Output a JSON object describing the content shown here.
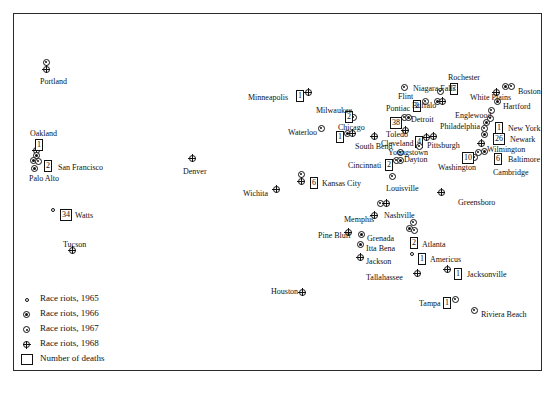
{
  "legend": {
    "items": [
      {
        "symbol": "open-circle-small",
        "label": "Race riots, 1965",
        "year": 1965
      },
      {
        "symbol": "filled-center-circle",
        "label": "Race riots, 1966",
        "year": 1966
      },
      {
        "symbol": "dot-circle",
        "label": "Race riots, 1967",
        "year": 1967
      },
      {
        "symbol": "crossed-circle",
        "label": "Race riots, 1968",
        "year": 1968
      }
    ],
    "deaths_label": "Number of deaths",
    "deaths_symbol": "square-box"
  },
  "map": {
    "background_color": "#d4d4d4",
    "border_color": "#2b2b2b",
    "water_color": "#ffffff",
    "cities": [
      {
        "name": "Portland",
        "label_x": 40,
        "label_y": 77,
        "markers": [
          {
            "x": 46,
            "y": 62,
            "year": 1967
          },
          {
            "x": 46,
            "y": 69,
            "year": 1968
          }
        ]
      },
      {
        "name": "Oakland",
        "label_x": 30,
        "label_y": 129,
        "deaths": "1",
        "deaths_x": 35,
        "deaths_y": 139,
        "markers": [
          {
            "x": 36,
            "y": 150,
            "year": 1968
          },
          {
            "x": 36,
            "y": 155,
            "year": 1966
          }
        ]
      },
      {
        "name": "San Francisco",
        "label_x": 58,
        "label_y": 163,
        "deaths": "2",
        "deaths_x": 44,
        "deaths_y": 160,
        "markers": [
          {
            "x": 33,
            "y": 160,
            "year": 1966
          },
          {
            "x": 38,
            "y": 161,
            "year": 1967
          }
        ]
      },
      {
        "name": "Palo Alto",
        "label_x": 29,
        "label_y": 174,
        "markers": [
          {
            "x": 34,
            "y": 168,
            "year": 1966
          }
        ]
      },
      {
        "name": "Watts",
        "label_x": 75,
        "label_y": 211,
        "deaths": "34",
        "deaths_x": 60,
        "deaths_y": 209,
        "markers": [
          {
            "x": 53,
            "y": 210,
            "year": 1965
          }
        ]
      },
      {
        "name": "Tucson",
        "label_x": 63,
        "label_y": 240,
        "markers": [
          {
            "x": 72,
            "y": 250,
            "year": 1968
          }
        ]
      },
      {
        "name": "Denver",
        "label_x": 183,
        "label_y": 167,
        "markers": [
          {
            "x": 192,
            "y": 158,
            "year": 1968
          }
        ]
      },
      {
        "name": "Wichita",
        "label_x": 243,
        "label_y": 189,
        "markers": [
          {
            "x": 276,
            "y": 189,
            "year": 1968
          }
        ]
      },
      {
        "name": "Kansas City",
        "label_x": 322,
        "label_y": 179,
        "deaths": "6",
        "deaths_x": 310,
        "deaths_y": 177,
        "markers": [
          {
            "x": 301,
            "y": 174,
            "year": 1967
          },
          {
            "x": 301,
            "y": 181,
            "year": 1968
          }
        ]
      },
      {
        "name": "Minneapolis",
        "label_x": 248,
        "label_y": 93,
        "deaths": "1",
        "deaths_x": 296,
        "deaths_y": 90,
        "markers": [
          {
            "x": 308,
            "y": 92,
            "year": 1968
          }
        ]
      },
      {
        "name": "Milwaukee",
        "label_x": 316,
        "label_y": 106,
        "deaths": "2",
        "deaths_x": 345,
        "deaths_y": 111,
        "markers": [
          {
            "x": 353,
            "y": 117,
            "year": 1967
          }
        ]
      },
      {
        "name": "Waterloo",
        "label_x": 288,
        "label_y": 128,
        "markers": [
          {
            "x": 321,
            "y": 128,
            "year": 1967
          }
        ]
      },
      {
        "name": "Chicago",
        "label_x": 338,
        "label_y": 123,
        "deaths": "1",
        "deaths_x": 336,
        "deaths_y": 131,
        "markers": [
          {
            "x": 347,
            "y": 133,
            "year": 1966
          },
          {
            "x": 352,
            "y": 133,
            "year": 1968
          }
        ]
      },
      {
        "name": "South Bend",
        "label_x": 355,
        "label_y": 142,
        "markers": [
          {
            "x": 374,
            "y": 136,
            "year": 1968
          }
        ]
      },
      {
        "name": "Pontiac",
        "label_x": 386,
        "label_y": 104,
        "deaths": "2",
        "deaths_x": 413,
        "deaths_y": 100,
        "markers": [
          {
            "x": 425,
            "y": 101,
            "year": 1967
          }
        ]
      },
      {
        "name": "Flint",
        "label_x": 398,
        "label_y": 92,
        "markers": [
          {
            "x": 404,
            "y": 87,
            "year": 1967
          }
        ]
      },
      {
        "name": "Detroit",
        "label_x": 411,
        "label_y": 115,
        "deaths": "38",
        "deaths_x": 390,
        "deaths_y": 117,
        "markers": [
          {
            "x": 404,
            "y": 117,
            "year": 1967
          },
          {
            "x": 408,
            "y": 117,
            "year": 1966
          }
        ]
      },
      {
        "name": "Toledo",
        "label_x": 386,
        "label_y": 130,
        "markers": [
          {
            "x": 405,
            "y": 130,
            "year": 1968
          }
        ]
      },
      {
        "name": "Cleveland",
        "label_x": 381,
        "label_y": 139,
        "deaths": "4",
        "deaths_x": 415,
        "deaths_y": 136,
        "markers": [
          {
            "x": 426,
            "y": 137,
            "year": 1968
          }
        ]
      },
      {
        "name": "Youngstown",
        "label_x": 388,
        "label_y": 148,
        "markers": [
          {
            "x": 419,
            "y": 146,
            "year": 1967
          }
        ]
      },
      {
        "name": "Dayton",
        "label_x": 404,
        "label_y": 155,
        "markers": [
          {
            "x": 400,
            "y": 152,
            "year": 1967
          }
        ]
      },
      {
        "name": "Cincinnati",
        "label_x": 348,
        "label_y": 161,
        "deaths": "2",
        "deaths_x": 385,
        "deaths_y": 159,
        "markers": [
          {
            "x": 396,
            "y": 160,
            "year": 1967
          },
          {
            "x": 400,
            "y": 160,
            "year": 1966
          }
        ]
      },
      {
        "name": "Louisville",
        "label_x": 386,
        "label_y": 184,
        "markers": [
          {
            "x": 392,
            "y": 176,
            "year": 1967
          }
        ]
      },
      {
        "name": "Niagara Falls",
        "label_x": 413,
        "label_y": 84,
        "markers": [
          {
            "x": 440,
            "y": 91,
            "year": 1967
          }
        ]
      },
      {
        "name": "Buffalo",
        "label_x": 412,
        "label_y": 101,
        "markers": [
          {
            "x": 437,
            "y": 101,
            "year": 1966
          },
          {
            "x": 442,
            "y": 101,
            "year": 1968
          }
        ]
      },
      {
        "name": "Rochester",
        "label_x": 448,
        "label_y": 73,
        "deaths": "7",
        "deaths_x": 450,
        "deaths_y": 83,
        "markers": []
      },
      {
        "name": "White Plains",
        "label_x": 470,
        "label_y": 93,
        "markers": [
          {
            "x": 496,
            "y": 92,
            "year": 1968
          }
        ]
      },
      {
        "name": "Hartford",
        "label_x": 503,
        "label_y": 102,
        "markers": [
          {
            "x": 497,
            "y": 101,
            "year": 1966
          }
        ]
      },
      {
        "name": "Boston",
        "label_x": 518,
        "label_y": 87,
        "markers": [
          {
            "x": 505,
            "y": 86,
            "year": 1966
          },
          {
            "x": 511,
            "y": 86,
            "year": 1967
          }
        ]
      },
      {
        "name": "Englewood",
        "label_x": 455,
        "label_y": 111,
        "markers": [
          {
            "x": 491,
            "y": 110,
            "year": 1967
          }
        ]
      },
      {
        "name": "New York",
        "label_x": 508,
        "label_y": 124,
        "deaths": "1",
        "deaths_x": 495,
        "deaths_y": 122,
        "markers": [
          {
            "x": 486,
            "y": 122,
            "year": 1966
          },
          {
            "x": 490,
            "y": 118,
            "year": 1967
          }
        ]
      },
      {
        "name": "Philadelphia",
        "label_x": 440,
        "label_y": 122,
        "markers": [
          {
            "x": 484,
            "y": 128,
            "year": 1967
          }
        ]
      },
      {
        "name": "Newark",
        "label_x": 510,
        "label_y": 135,
        "deaths": "26",
        "deaths_x": 493,
        "deaths_y": 133,
        "markers": [
          {
            "x": 484,
            "y": 134,
            "year": 1966
          }
        ]
      },
      {
        "name": "Pittsburgh",
        "label_x": 427,
        "label_y": 141,
        "markers": [
          {
            "x": 433,
            "y": 136,
            "year": 1968
          }
        ]
      },
      {
        "name": "Wilmington",
        "label_x": 487,
        "label_y": 145,
        "markers": [
          {
            "x": 481,
            "y": 143,
            "year": 1968
          }
        ]
      },
      {
        "name": "Baltimore",
        "label_x": 508,
        "label_y": 155,
        "deaths": "6",
        "deaths_x": 494,
        "deaths_y": 153,
        "markers": [
          {
            "x": 478,
            "y": 152,
            "year": 1967
          },
          {
            "x": 484,
            "y": 151,
            "year": 1966
          }
        ]
      },
      {
        "name": "Washington",
        "label_x": 438,
        "label_y": 163,
        "deaths": "10",
        "deaths_x": 462,
        "deaths_y": 152,
        "markers": [
          {
            "x": 474,
            "y": 157,
            "year": 1967
          }
        ]
      },
      {
        "name": "Cambridge",
        "label_x": 493,
        "label_y": 168,
        "markers": []
      },
      {
        "name": "Greensboro",
        "label_x": 458,
        "label_y": 198,
        "markers": [
          {
            "x": 441,
            "y": 192,
            "year": 1968
          }
        ]
      },
      {
        "name": "Nashville",
        "label_x": 384,
        "label_y": 211,
        "markers": [
          {
            "x": 380,
            "y": 203,
            "year": 1967
          },
          {
            "x": 386,
            "y": 203,
            "year": 1968
          }
        ]
      },
      {
        "name": "Memphis",
        "label_x": 344,
        "label_y": 215,
        "markers": [
          {
            "x": 374,
            "y": 215,
            "year": 1968
          }
        ]
      },
      {
        "name": "Pine Bluff",
        "label_x": 318,
        "label_y": 231,
        "markers": [
          {
            "x": 348,
            "y": 232,
            "year": 1968
          }
        ]
      },
      {
        "name": "Grenada",
        "label_x": 367,
        "label_y": 234,
        "markers": [
          {
            "x": 361,
            "y": 234,
            "year": 1966
          }
        ]
      },
      {
        "name": "Itta Bena",
        "label_x": 366,
        "label_y": 244,
        "markers": [
          {
            "x": 360,
            "y": 244,
            "year": 1966
          }
        ]
      },
      {
        "name": "Jackson",
        "label_x": 366,
        "label_y": 257,
        "markers": [
          {
            "x": 360,
            "y": 257,
            "year": 1968
          }
        ]
      },
      {
        "name": "Atlanta",
        "label_x": 422,
        "label_y": 240,
        "deaths": "2",
        "deaths_x": 410,
        "deaths_y": 237,
        "markers": [
          {
            "x": 413,
            "y": 222,
            "year": 1967
          },
          {
            "x": 409,
            "y": 228,
            "year": 1966
          },
          {
            "x": 414,
            "y": 230,
            "year": 1967
          }
        ]
      },
      {
        "name": "Americus",
        "label_x": 430,
        "label_y": 255,
        "deaths": "1",
        "deaths_x": 418,
        "deaths_y": 253,
        "markers": [
          {
            "x": 412,
            "y": 254,
            "year": 1965
          }
        ]
      },
      {
        "name": "Tallahassee",
        "label_x": 366,
        "label_y": 273,
        "markers": [
          {
            "x": 417,
            "y": 273,
            "year": 1968
          }
        ]
      },
      {
        "name": "Jacksonville",
        "label_x": 467,
        "label_y": 270,
        "deaths": "1",
        "deaths_x": 454,
        "deaths_y": 268,
        "markers": [
          {
            "x": 447,
            "y": 269,
            "year": 1968
          }
        ]
      },
      {
        "name": "Tampa",
        "label_x": 419,
        "label_y": 299,
        "deaths": "1",
        "deaths_x": 443,
        "deaths_y": 297,
        "markers": [
          {
            "x": 455,
            "y": 299,
            "year": 1967
          }
        ]
      },
      {
        "name": "Riviera Beach",
        "label_x": 481,
        "label_y": 310,
        "markers": [
          {
            "x": 474,
            "y": 310,
            "year": 1967
          }
        ]
      },
      {
        "name": "Houston",
        "label_x": 271,
        "label_y": 287,
        "markers": [
          {
            "x": 302,
            "y": 292,
            "year": 1968
          }
        ]
      }
    ]
  }
}
